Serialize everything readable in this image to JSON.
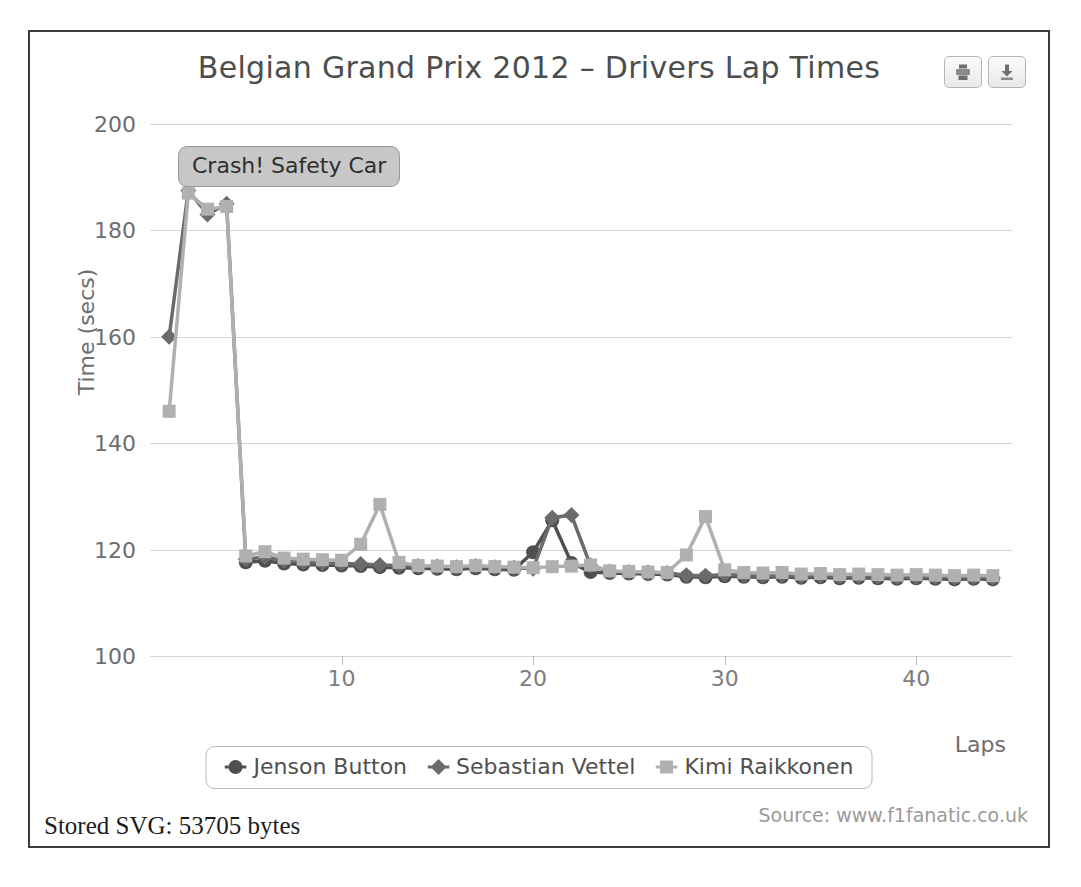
{
  "card": {
    "title": "Belgian Grand Prix 2012 – Drivers Lap Times",
    "source": "Source: www.f1fanatic.co.uk",
    "stored_svg": "Stored SVG: 53705 bytes",
    "annotation": "Crash! Safety Car",
    "print_icon": "print-icon",
    "download_icon": "download-icon"
  },
  "colors": {
    "button": "#4f4f4f",
    "vettel": "#6b6b6b",
    "kimi": "#b0b0b0",
    "grid": "#cfcfcf",
    "frame": "#3a3a3a",
    "annotation_bg": "#c7c7c7"
  },
  "chart_data": {
    "type": "line",
    "title": "Belgian Grand Prix 2012 – Drivers Lap Times",
    "xlabel": "Laps",
    "ylabel": "Time (secs)",
    "xlim": [
      0,
      45
    ],
    "ylim": [
      100,
      200
    ],
    "xticks": [
      10,
      20,
      30,
      40
    ],
    "yticks": [
      100,
      120,
      140,
      160,
      180,
      200
    ],
    "grid": true,
    "legend_position": "bottom-center",
    "annotations": [
      {
        "text": "Crash! Safety Car",
        "x": 2,
        "y": 197
      }
    ],
    "x": [
      1,
      2,
      3,
      4,
      5,
      6,
      7,
      8,
      9,
      10,
      11,
      12,
      13,
      14,
      15,
      16,
      17,
      18,
      19,
      20,
      21,
      22,
      23,
      24,
      25,
      26,
      27,
      28,
      29,
      30,
      31,
      32,
      33,
      34,
      35,
      36,
      37,
      38,
      39,
      40,
      41,
      42,
      43,
      44
    ],
    "series": [
      {
        "name": "Jenson Button",
        "marker": "circle",
        "color": "#4f4f4f",
        "values": [
          null,
          null,
          null,
          null,
          117.6,
          117.9,
          117.4,
          117.2,
          117.1,
          117.0,
          116.9,
          116.7,
          116.6,
          116.5,
          116.4,
          116.3,
          116.5,
          116.3,
          116.2,
          119.5,
          125.5,
          117.5,
          115.8,
          115.6,
          115.5,
          115.4,
          115.3,
          114.9,
          114.8,
          115.0,
          114.9,
          114.8,
          114.9,
          114.7,
          114.8,
          114.6,
          114.7,
          114.6,
          114.5,
          114.6,
          114.5,
          114.4,
          114.5,
          114.4
        ]
      },
      {
        "name": "Sebastian Vettel",
        "marker": "diamond",
        "color": "#6b6b6b",
        "values": [
          160.0,
          187.5,
          183.0,
          185.0,
          118.2,
          118.6,
          117.9,
          117.6,
          117.5,
          117.4,
          117.3,
          117.1,
          117.0,
          116.9,
          116.8,
          116.7,
          116.9,
          116.7,
          116.6,
          116.4,
          126.0,
          126.5,
          117.0,
          115.9,
          115.8,
          115.7,
          115.6,
          115.2,
          115.1,
          115.3,
          115.2,
          115.1,
          115.2,
          115.0,
          115.1,
          114.9,
          115.0,
          114.9,
          114.8,
          114.9,
          114.8,
          114.7,
          114.8,
          114.7
        ]
      },
      {
        "name": "Kimi Raikkonen",
        "marker": "square",
        "color": "#b0b0b0",
        "values": [
          146.0,
          187.0,
          184.0,
          184.5,
          118.8,
          119.6,
          118.4,
          118.2,
          118.1,
          118.0,
          121.0,
          128.5,
          117.6,
          117.0,
          116.9,
          116.8,
          117.0,
          116.8,
          116.7,
          116.6,
          116.8,
          116.9,
          117.1,
          116.0,
          115.9,
          115.8,
          115.7,
          119.0,
          126.2,
          116.2,
          115.7,
          115.6,
          115.7,
          115.4,
          115.5,
          115.3,
          115.4,
          115.3,
          115.2,
          115.3,
          115.2,
          115.1,
          115.2,
          115.1
        ]
      }
    ]
  }
}
